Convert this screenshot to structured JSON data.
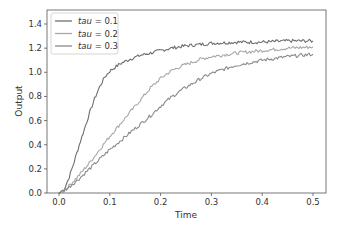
{
  "chart_data": {
    "type": "line",
    "title": "",
    "xlabel": "Time",
    "ylabel": "Output",
    "xlim": [
      -0.025,
      0.525
    ],
    "ylim": [
      0.0,
      1.5
    ],
    "xticks": [
      0.0,
      0.1,
      0.2,
      0.3,
      0.4,
      0.5
    ],
    "xtick_labels": [
      "0.0",
      "0.1",
      "0.2",
      "0.3",
      "0.4",
      "0.5"
    ],
    "yticks": [
      0.0,
      0.2,
      0.4,
      0.6,
      0.8,
      1.0,
      1.2,
      1.4
    ],
    "ytick_labels": [
      "0.0",
      "0.2",
      "0.4",
      "0.6",
      "0.8",
      "1.0",
      "1.2",
      "1.4"
    ],
    "grid": false,
    "legend_position": "upper left",
    "series": [
      {
        "name": "tau = 0.1",
        "legend_var": "tau",
        "legend_val": " = 0.1",
        "color": "#6e6e6e",
        "x": [
          0.0,
          0.01,
          0.02,
          0.03,
          0.04,
          0.05,
          0.06,
          0.07,
          0.08,
          0.09,
          0.1,
          0.12,
          0.14,
          0.16,
          0.18,
          0.2,
          0.22,
          0.25,
          0.3,
          0.35,
          0.4,
          0.45,
          0.5
        ],
        "y": [
          0.0,
          0.03,
          0.13,
          0.26,
          0.4,
          0.53,
          0.66,
          0.78,
          0.88,
          0.96,
          1.01,
          1.07,
          1.11,
          1.14,
          1.16,
          1.18,
          1.2,
          1.22,
          1.24,
          1.25,
          1.25,
          1.26,
          1.26
        ]
      },
      {
        "name": "tau = 0.2",
        "legend_var": "tau",
        "legend_val": " = 0.2",
        "color": "#a8a8a8",
        "x": [
          0.0,
          0.01,
          0.02,
          0.04,
          0.06,
          0.08,
          0.1,
          0.12,
          0.14,
          0.16,
          0.18,
          0.2,
          0.22,
          0.24,
          0.26,
          0.28,
          0.3,
          0.35,
          0.4,
          0.45,
          0.5
        ],
        "y": [
          0.0,
          0.02,
          0.06,
          0.15,
          0.25,
          0.36,
          0.47,
          0.57,
          0.67,
          0.77,
          0.87,
          0.95,
          1.01,
          1.05,
          1.08,
          1.11,
          1.13,
          1.16,
          1.18,
          1.2,
          1.21
        ]
      },
      {
        "name": "tau = 0.3",
        "legend_var": "tau",
        "legend_val": " = 0.3",
        "color": "#8a8a8a",
        "x": [
          0.0,
          0.01,
          0.02,
          0.04,
          0.06,
          0.08,
          0.1,
          0.12,
          0.14,
          0.16,
          0.18,
          0.2,
          0.22,
          0.24,
          0.26,
          0.28,
          0.3,
          0.32,
          0.35,
          0.4,
          0.45,
          0.5
        ],
        "y": [
          0.0,
          0.02,
          0.05,
          0.12,
          0.2,
          0.28,
          0.36,
          0.43,
          0.5,
          0.57,
          0.64,
          0.72,
          0.79,
          0.85,
          0.9,
          0.95,
          0.99,
          1.02,
          1.06,
          1.1,
          1.13,
          1.15
        ]
      }
    ]
  },
  "style": {
    "axes_color": "#555555",
    "background": "#ffffff",
    "legend_border": "#cccccc"
  }
}
